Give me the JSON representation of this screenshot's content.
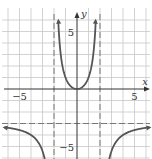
{
  "chart_data": {
    "type": "line",
    "title": "",
    "xlabel": "x",
    "ylabel": "y",
    "xlim": [
      -6.5,
      6.5
    ],
    "ylim": [
      -6,
      7.5
    ],
    "grid": true,
    "x_tick_labels": [
      {
        "value": -5,
        "label": "−5"
      },
      {
        "value": 5,
        "label": "5"
      }
    ],
    "y_tick_labels": [
      {
        "value": 5,
        "label": "5"
      },
      {
        "value": -5,
        "label": "−5"
      }
    ],
    "asymptotes": {
      "vertical": [
        -2,
        2
      ],
      "horizontal": [
        -3
      ]
    },
    "function": "y = 3x^2 / (4 - x^2)",
    "series": [
      {
        "name": "left-branch",
        "x": [
          -6.3,
          -6,
          -5,
          -4,
          -3.5,
          -3,
          -2.7
        ],
        "y": [
          -3.34,
          -3.375,
          -3.57,
          -4.0,
          -4.45,
          -5.4,
          -6.6
        ]
      },
      {
        "name": "middle-branch",
        "x": [
          -1.6,
          -1.5,
          -1.25,
          -1,
          -0.5,
          0,
          0.5,
          1,
          1.25,
          1.5,
          1.6
        ],
        "y": [
          5.33,
          3.86,
          1.92,
          1.0,
          0.2,
          0,
          0.2,
          1.0,
          1.92,
          3.86,
          5.33
        ]
      },
      {
        "name": "right-branch",
        "x": [
          2.7,
          3,
          3.5,
          4,
          5,
          6,
          6.3
        ],
        "y": [
          -6.6,
          -5.4,
          -4.45,
          -4.0,
          -3.57,
          -3.375,
          -3.34
        ]
      }
    ],
    "colors": {
      "curve": "#555555",
      "grid": "#c8c8c8",
      "axis": "#333333",
      "asymptote": "#777777"
    }
  }
}
